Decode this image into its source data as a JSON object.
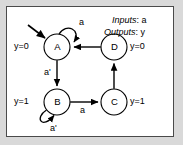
{
  "figure": {
    "type": "state-transition-diagram",
    "border_color": "#4a4a4a",
    "background": "#ffffff",
    "outer_background": "#d9d9d9",
    "stroke_color": "#000000"
  },
  "header": {
    "inputs_key": "Inputs",
    "inputs_value": "a",
    "outputs_key": "Outputs",
    "outputs_value": "y",
    "inputs_text": "Inputs: a",
    "outputs_text": "Outputs: y"
  },
  "states": [
    {
      "id": "A",
      "label": "A",
      "output_label": "y=0",
      "output_side": "left",
      "cx": 57,
      "cy": 47,
      "r": 13,
      "initial": true
    },
    {
      "id": "B",
      "label": "B",
      "output_label": "y=1",
      "output_side": "left",
      "cx": 57,
      "cy": 102,
      "r": 13,
      "initial": false
    },
    {
      "id": "C",
      "label": "C",
      "output_label": "y=1",
      "output_side": "right",
      "cx": 114,
      "cy": 102,
      "r": 13,
      "initial": false
    },
    {
      "id": "D",
      "label": "D",
      "output_label": "y=0",
      "output_side": "right",
      "cx": 114,
      "cy": 47,
      "r": 13,
      "initial": false
    }
  ],
  "transitions": [
    {
      "from": "A",
      "to": "A",
      "condition": "a",
      "kind": "self-loop-top"
    },
    {
      "from": "A",
      "to": "B",
      "condition": "a'",
      "kind": "vertical-down"
    },
    {
      "from": "B",
      "to": "B",
      "condition": "a'",
      "kind": "self-loop-bottom"
    },
    {
      "from": "B",
      "to": "C",
      "condition": "a",
      "kind": "horizontal-right"
    },
    {
      "from": "C",
      "to": "D",
      "condition": "",
      "kind": "vertical-up"
    },
    {
      "from": "D",
      "to": "A",
      "condition": "",
      "kind": "horizontal-left"
    }
  ],
  "labels": {
    "a_loop_A": "a",
    "a_prime_AB": "a'",
    "a_prime_loop_B": "a'",
    "a_BC": "a",
    "y0_A": "y=0",
    "y1_B": "y=1",
    "y1_C": "y=1",
    "y0_D": "y=0"
  }
}
